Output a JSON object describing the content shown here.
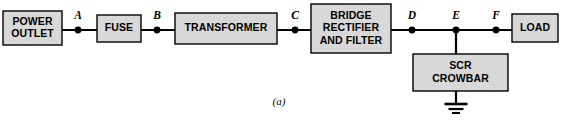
{
  "figure": {
    "caption": "(a)",
    "caption_x": 279,
    "caption_y": 105
  },
  "style": {
    "block_fill": "#d8d8d8",
    "block_stroke": "#000000",
    "wire_color": "#000000",
    "background": "#ffffff"
  },
  "blocks": [
    {
      "id": "power-outlet",
      "lines": [
        "POWER",
        "OUTLET"
      ],
      "x": 3,
      "y": 11,
      "w": 59,
      "h": 34
    },
    {
      "id": "fuse",
      "lines": [
        "FUSE"
      ],
      "x": 97,
      "y": 15,
      "w": 44,
      "h": 27
    },
    {
      "id": "transformer",
      "lines": [
        "TRANSFORMER"
      ],
      "x": 175,
      "y": 13,
      "w": 102,
      "h": 31
    },
    {
      "id": "bridge-rectifier-and-filter",
      "lines": [
        "BRIDGE",
        "RECTIFIER",
        "AND FILTER"
      ],
      "x": 311,
      "y": 4,
      "w": 80,
      "h": 49
    },
    {
      "id": "scr-crowbar",
      "lines": [
        "SCR",
        "CROWBAR"
      ],
      "x": 413,
      "y": 54,
      "w": 95,
      "h": 37
    },
    {
      "id": "load",
      "lines": [
        "LOAD"
      ],
      "x": 512,
      "y": 14,
      "w": 46,
      "h": 28
    }
  ],
  "wires": [
    {
      "id": "wire-outlet-to-fuse",
      "x1": 62,
      "y1": 30,
      "x2": 97,
      "y2": 30
    },
    {
      "id": "wire-fuse-to-transformer",
      "x1": 141,
      "y1": 30,
      "x2": 175,
      "y2": 30
    },
    {
      "id": "wire-transformer-to-rectifier",
      "x1": 277,
      "y1": 30,
      "x2": 311,
      "y2": 30
    },
    {
      "id": "wire-rectifier-to-load",
      "x1": 391,
      "y1": 30,
      "x2": 512,
      "y2": 30
    },
    {
      "id": "wire-node-e-to-crowbar",
      "x1": 456,
      "y1": 30,
      "x2": 456,
      "y2": 54
    },
    {
      "id": "wire-crowbar-to-ground",
      "x1": 456,
      "y1": 91,
      "x2": 456,
      "y2": 104
    }
  ],
  "nodes": [
    {
      "id": "node-a",
      "label": "A",
      "x": 78,
      "y": 30,
      "label_x": 78,
      "label_y": 19
    },
    {
      "id": "node-b",
      "label": "B",
      "x": 157,
      "y": 30,
      "label_x": 157,
      "label_y": 19
    },
    {
      "id": "node-c",
      "label": "C",
      "x": 295,
      "y": 30,
      "label_x": 295,
      "label_y": 19
    },
    {
      "id": "node-d",
      "label": "D",
      "x": 412,
      "y": 30,
      "label_x": 412,
      "label_y": 19
    },
    {
      "id": "node-e",
      "label": "E",
      "x": 456,
      "y": 30,
      "label_x": 456,
      "label_y": 19
    },
    {
      "id": "node-f",
      "label": "F",
      "x": 496,
      "y": 30,
      "label_x": 496,
      "label_y": 19
    }
  ],
  "node_dot_radius": 3.4,
  "ground": {
    "id": "ground-symbol",
    "x": 456,
    "bars": [
      {
        "y": 104,
        "half_width": 11.5,
        "thickness": 2.6
      },
      {
        "y": 109,
        "half_width": 7.5,
        "thickness": 2.2
      },
      {
        "y": 113,
        "half_width": 4.0,
        "thickness": 2.0
      }
    ]
  }
}
